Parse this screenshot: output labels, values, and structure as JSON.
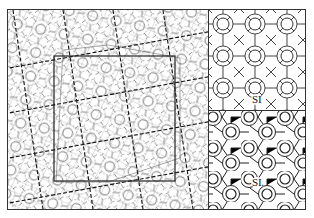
{
  "figure": {
    "left_panel": {
      "description": "quasicrystalline tiling with superimposed square approximant cell and dashed lattice lines"
    },
    "right_top": {
      "label": "SI"
    },
    "right_bottom": {
      "label": "SI"
    }
  },
  "colors": {
    "line": "#333333",
    "dashed": "#111111",
    "background": "#ffffff"
  }
}
